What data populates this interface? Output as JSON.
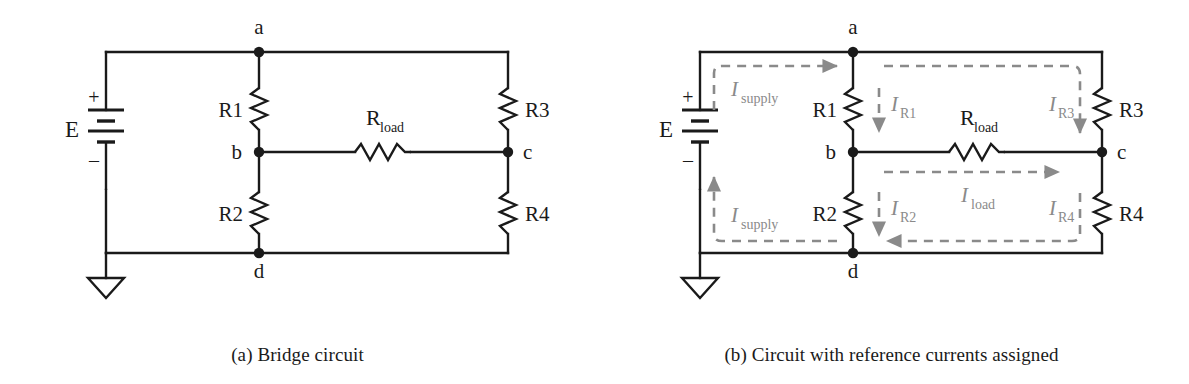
{
  "figure": {
    "colors": {
      "wire": "#1a1a1a",
      "text": "#1a1a1a",
      "current_arrow": "#8a8a8a",
      "background": "#ffffff"
    }
  },
  "panel_a": {
    "caption": "(a) Bridge circuit",
    "source_label": "E",
    "polarity_plus": "+",
    "polarity_minus": "–",
    "nodes": [
      {
        "id": "a",
        "label": "a"
      },
      {
        "id": "b",
        "label": "b"
      },
      {
        "id": "c",
        "label": "c"
      },
      {
        "id": "d",
        "label": "d"
      }
    ],
    "resistors": [
      {
        "id": "R1",
        "label": "R1",
        "orientation": "vertical"
      },
      {
        "id": "R2",
        "label": "R2",
        "orientation": "vertical"
      },
      {
        "id": "R3",
        "label": "R3",
        "orientation": "vertical"
      },
      {
        "id": "R4",
        "label": "R4",
        "orientation": "vertical"
      },
      {
        "id": "Rload",
        "label_main": "R",
        "label_sub": "load",
        "orientation": "horizontal"
      }
    ],
    "ground_symbol": "earth-ground"
  },
  "panel_b": {
    "caption": "(b) Circuit with reference currents assigned",
    "source_label": "E",
    "polarity_plus": "+",
    "polarity_minus": "–",
    "nodes": [
      {
        "id": "a",
        "label": "a"
      },
      {
        "id": "b",
        "label": "b"
      },
      {
        "id": "c",
        "label": "c"
      },
      {
        "id": "d",
        "label": "d"
      }
    ],
    "resistors": [
      {
        "id": "R1",
        "label": "R1",
        "orientation": "vertical"
      },
      {
        "id": "R2",
        "label": "R2",
        "orientation": "vertical"
      },
      {
        "id": "R3",
        "label": "R3",
        "orientation": "vertical"
      },
      {
        "id": "R4",
        "label": "R4",
        "orientation": "vertical"
      },
      {
        "id": "Rload",
        "label_main": "R",
        "label_sub": "load",
        "orientation": "horizontal"
      }
    ],
    "currents": [
      {
        "id": "Isupply_top",
        "symbol": "I",
        "subscript": "supply",
        "direction": "right"
      },
      {
        "id": "Isupply_bottom",
        "symbol": "I",
        "subscript": "supply",
        "direction": "up"
      },
      {
        "id": "IR1",
        "symbol": "I",
        "subscript": "R1",
        "direction": "down"
      },
      {
        "id": "IR2",
        "symbol": "I",
        "subscript": "R2",
        "direction": "down"
      },
      {
        "id": "IR3",
        "symbol": "I",
        "subscript": "R3",
        "direction": "down"
      },
      {
        "id": "IR4",
        "symbol": "I",
        "subscript": "R4",
        "direction": "down"
      },
      {
        "id": "Iload",
        "symbol": "I",
        "subscript": "load",
        "direction": "right"
      }
    ],
    "ground_symbol": "earth-ground"
  }
}
